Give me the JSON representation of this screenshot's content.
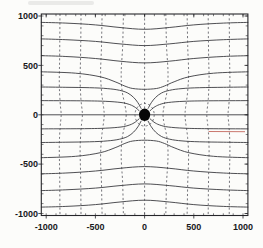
{
  "figure": {
    "artifact_note": "faint scan smudge of cropped text at top-left; stray red pen/print segment at right middle"
  },
  "chart_data": {
    "type": "line",
    "variant": "field-line-diagram",
    "title": "",
    "xlabel": "",
    "ylabel": "",
    "axes": {
      "xlim": [
        -1050,
        1050
      ],
      "ylim": [
        -1020,
        1020
      ],
      "x_ticks": [
        -1000,
        -500,
        0,
        500,
        1000
      ],
      "x_tick_labels": [
        "-1000",
        "-500",
        "0",
        "500",
        "1000"
      ],
      "y_ticks": [
        1000,
        500,
        0,
        -500,
        -1000
      ],
      "y_tick_labels": [
        "1000",
        "500",
        "0",
        "-500",
        "-1000"
      ],
      "minor_tick_step": 100,
      "grid": false
    },
    "central_dot": {
      "x": 0,
      "y": 0,
      "rx": 57,
      "ry": 63
    },
    "closed_dashed_oval": {
      "cx": 0,
      "cy": 0,
      "rx": 98,
      "ry": 114
    },
    "red_artifact_segment": {
      "x1": 650,
      "y1": -170,
      "x2": 1020,
      "y2": -172
    },
    "solid_field_lines": [
      {
        "name": "pass-top-1",
        "points": [
          [
            -1050,
            935
          ],
          [
            -800,
            928
          ],
          [
            -500,
            910
          ],
          [
            -250,
            883
          ],
          [
            0,
            865
          ],
          [
            250,
            883
          ],
          [
            500,
            910
          ],
          [
            800,
            928
          ],
          [
            1050,
            935
          ]
        ]
      },
      {
        "name": "pass-top-2",
        "points": [
          [
            -1050,
            768
          ],
          [
            -800,
            760
          ],
          [
            -500,
            743
          ],
          [
            -250,
            717
          ],
          [
            0,
            700
          ],
          [
            250,
            717
          ],
          [
            500,
            743
          ],
          [
            800,
            760
          ],
          [
            1050,
            768
          ]
        ]
      },
      {
        "name": "pass-top-3",
        "points": [
          [
            -1050,
            598
          ],
          [
            -800,
            590
          ],
          [
            -500,
            570
          ],
          [
            -250,
            542
          ],
          [
            0,
            525
          ],
          [
            250,
            542
          ],
          [
            500,
            570
          ],
          [
            800,
            590
          ],
          [
            1050,
            598
          ]
        ]
      },
      {
        "name": "pass-top-4",
        "points": [
          [
            -1050,
            435
          ],
          [
            -700,
            421
          ],
          [
            -450,
            384
          ],
          [
            -300,
            334
          ],
          [
            -200,
            290
          ],
          [
            -120,
            266
          ],
          [
            0,
            258
          ],
          [
            120,
            266
          ],
          [
            200,
            290
          ],
          [
            300,
            334
          ],
          [
            450,
            384
          ],
          [
            700,
            421
          ],
          [
            1050,
            435
          ]
        ]
      },
      {
        "name": "pass-bottom-1",
        "points": [
          [
            -1050,
            -935
          ],
          [
            -800,
            -928
          ],
          [
            -500,
            -910
          ],
          [
            -250,
            -883
          ],
          [
            0,
            -865
          ],
          [
            250,
            -883
          ],
          [
            500,
            -910
          ],
          [
            800,
            -928
          ],
          [
            1050,
            -935
          ]
        ]
      },
      {
        "name": "pass-bottom-2",
        "points": [
          [
            -1050,
            -768
          ],
          [
            -800,
            -760
          ],
          [
            -500,
            -743
          ],
          [
            -250,
            -717
          ],
          [
            0,
            -700
          ],
          [
            250,
            -717
          ],
          [
            500,
            -743
          ],
          [
            800,
            -760
          ],
          [
            1050,
            -768
          ]
        ]
      },
      {
        "name": "pass-bottom-3",
        "points": [
          [
            -1050,
            -598
          ],
          [
            -800,
            -590
          ],
          [
            -500,
            -570
          ],
          [
            -250,
            -542
          ],
          [
            0,
            -525
          ],
          [
            250,
            -542
          ],
          [
            500,
            -570
          ],
          [
            800,
            -590
          ],
          [
            1050,
            -598
          ]
        ]
      },
      {
        "name": "pass-bottom-4",
        "points": [
          [
            -1050,
            -435
          ],
          [
            -700,
            -421
          ],
          [
            -450,
            -384
          ],
          [
            -300,
            -334
          ],
          [
            -200,
            -290
          ],
          [
            -120,
            -266
          ],
          [
            0,
            -258
          ],
          [
            120,
            -266
          ],
          [
            200,
            -290
          ],
          [
            300,
            -334
          ],
          [
            450,
            -384
          ],
          [
            700,
            -421
          ],
          [
            1050,
            -435
          ]
        ]
      },
      {
        "name": "axis-line-left",
        "points": [
          [
            -1050,
            0
          ],
          [
            -58,
            0
          ]
        ]
      },
      {
        "name": "axis-line-right",
        "points": [
          [
            58,
            0
          ],
          [
            1050,
            0
          ]
        ]
      },
      {
        "name": "captured-ne-shallow",
        "points": [
          [
            55,
            40
          ],
          [
            95,
            74
          ],
          [
            150,
            103
          ],
          [
            240,
            124
          ],
          [
            400,
            136
          ],
          [
            650,
            141
          ],
          [
            1050,
            143
          ]
        ]
      },
      {
        "name": "captured-nw-shallow",
        "points": [
          [
            -55,
            40
          ],
          [
            -95,
            74
          ],
          [
            -150,
            103
          ],
          [
            -240,
            124
          ],
          [
            -400,
            136
          ],
          [
            -650,
            141
          ],
          [
            -1050,
            143
          ]
        ]
      },
      {
        "name": "captured-se-shallow",
        "points": [
          [
            55,
            -40
          ],
          [
            95,
            -74
          ],
          [
            150,
            -103
          ],
          [
            240,
            -124
          ],
          [
            400,
            -136
          ],
          [
            650,
            -141
          ],
          [
            1050,
            -143
          ]
        ]
      },
      {
        "name": "captured-sw-shallow",
        "points": [
          [
            -55,
            -40
          ],
          [
            -95,
            -74
          ],
          [
            -150,
            -103
          ],
          [
            -240,
            -124
          ],
          [
            -400,
            -136
          ],
          [
            -650,
            -141
          ],
          [
            -1050,
            -143
          ]
        ]
      },
      {
        "name": "captured-ne-steep",
        "points": [
          [
            36,
            64
          ],
          [
            68,
            122
          ],
          [
            112,
            176
          ],
          [
            172,
            220
          ],
          [
            255,
            248
          ],
          [
            380,
            265
          ],
          [
            560,
            274
          ],
          [
            800,
            278
          ],
          [
            1050,
            281
          ]
        ]
      },
      {
        "name": "captured-nw-steep",
        "points": [
          [
            -36,
            64
          ],
          [
            -68,
            122
          ],
          [
            -112,
            176
          ],
          [
            -172,
            220
          ],
          [
            -255,
            248
          ],
          [
            -380,
            265
          ],
          [
            -560,
            274
          ],
          [
            -800,
            278
          ],
          [
            -1050,
            281
          ]
        ]
      },
      {
        "name": "captured-se-steep",
        "points": [
          [
            36,
            -64
          ],
          [
            68,
            -122
          ],
          [
            112,
            -176
          ],
          [
            172,
            -220
          ],
          [
            255,
            -248
          ],
          [
            380,
            -265
          ],
          [
            560,
            -274
          ],
          [
            800,
            -278
          ],
          [
            1050,
            -281
          ]
        ]
      },
      {
        "name": "captured-sw-steep",
        "points": [
          [
            -36,
            -64
          ],
          [
            -68,
            -122
          ],
          [
            -112,
            -176
          ],
          [
            -172,
            -220
          ],
          [
            -255,
            -248
          ],
          [
            -380,
            -265
          ],
          [
            -560,
            -274
          ],
          [
            -800,
            -278
          ],
          [
            -1050,
            -281
          ]
        ]
      }
    ],
    "dashed_equipotential_lines": [
      {
        "name": "equi-center",
        "points": [
          [
            0,
            1020
          ],
          [
            0,
            -1020
          ]
        ]
      },
      {
        "name": "equi-r1",
        "points": [
          [
            215,
            1020
          ],
          [
            223,
            700
          ],
          [
            238,
            430
          ],
          [
            230,
            250
          ],
          [
            198,
            90
          ],
          [
            187,
            0
          ],
          [
            198,
            -90
          ],
          [
            230,
            -250
          ],
          [
            238,
            -430
          ],
          [
            223,
            -700
          ],
          [
            215,
            -1020
          ]
        ]
      },
      {
        "name": "equi-l1",
        "points": [
          [
            -215,
            1020
          ],
          [
            -223,
            700
          ],
          [
            -238,
            430
          ],
          [
            -230,
            250
          ],
          [
            -198,
            90
          ],
          [
            -187,
            0
          ],
          [
            -198,
            -90
          ],
          [
            -230,
            -250
          ],
          [
            -238,
            -430
          ],
          [
            -223,
            -700
          ],
          [
            -215,
            -1020
          ]
        ]
      },
      {
        "name": "equi-r2",
        "points": [
          [
            432,
            1020
          ],
          [
            438,
            700
          ],
          [
            447,
            430
          ],
          [
            437,
            230
          ],
          [
            417,
            75
          ],
          [
            411,
            0
          ],
          [
            417,
            -75
          ],
          [
            437,
            -230
          ],
          [
            447,
            -430
          ],
          [
            438,
            -700
          ],
          [
            432,
            -1020
          ]
        ]
      },
      {
        "name": "equi-l2",
        "points": [
          [
            -432,
            1020
          ],
          [
            -438,
            700
          ],
          [
            -447,
            430
          ],
          [
            -437,
            230
          ],
          [
            -417,
            75
          ],
          [
            -411,
            0
          ],
          [
            -417,
            -75
          ],
          [
            -437,
            -230
          ],
          [
            -447,
            -430
          ],
          [
            -438,
            -700
          ],
          [
            -432,
            -1020
          ]
        ]
      },
      {
        "name": "equi-r3",
        "points": [
          [
            646,
            1020
          ],
          [
            650,
            620
          ],
          [
            655,
            360
          ],
          [
            647,
            160
          ],
          [
            635,
            45
          ],
          [
            632,
            0
          ],
          [
            635,
            -45
          ],
          [
            647,
            -160
          ],
          [
            655,
            -360
          ],
          [
            650,
            -620
          ],
          [
            646,
            -1020
          ]
        ]
      },
      {
        "name": "equi-l3",
        "points": [
          [
            -646,
            1020
          ],
          [
            -650,
            620
          ],
          [
            -655,
            360
          ],
          [
            -647,
            160
          ],
          [
            -635,
            45
          ],
          [
            -632,
            0
          ],
          [
            -635,
            -45
          ],
          [
            -647,
            -160
          ],
          [
            -655,
            -360
          ],
          [
            -650,
            -620
          ],
          [
            -646,
            -1020
          ]
        ]
      },
      {
        "name": "equi-r4",
        "points": [
          [
            860,
            1020
          ],
          [
            863,
            620
          ],
          [
            867,
            320
          ],
          [
            859,
            130
          ],
          [
            850,
            35
          ],
          [
            848,
            0
          ],
          [
            850,
            -35
          ],
          [
            859,
            -130
          ],
          [
            867,
            -320
          ],
          [
            863,
            -620
          ],
          [
            860,
            -1020
          ]
        ]
      },
      {
        "name": "equi-l4",
        "points": [
          [
            -860,
            1020
          ],
          [
            -863,
            620
          ],
          [
            -867,
            320
          ],
          [
            -859,
            130
          ],
          [
            -850,
            35
          ],
          [
            -848,
            0
          ],
          [
            -850,
            -35
          ],
          [
            -859,
            -130
          ],
          [
            -867,
            -320
          ],
          [
            -863,
            -620
          ],
          [
            -860,
            -1020
          ]
        ]
      }
    ],
    "styles": {
      "background": "#fcfcfa",
      "frame_color": "#26262a",
      "solid_line_color": "#3b3b40",
      "dashed_line_color": "#54545c",
      "label_color": "#18181c",
      "dot_color": "#070707",
      "red_artifact_color": "#c4685e"
    }
  }
}
